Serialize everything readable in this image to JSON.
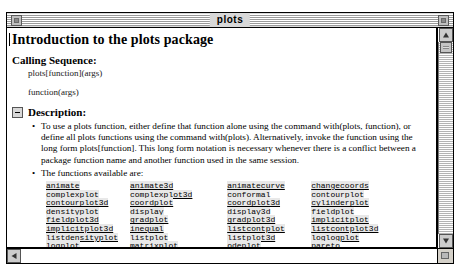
{
  "window": {
    "title": "plots",
    "close_box": "close-box",
    "zoom_box": "zoom-box"
  },
  "document": {
    "title": "Introduction to the plots package",
    "calling_sequence": {
      "heading": "Calling Sequence:",
      "lines": [
        "plots[function](args)",
        "function(args)"
      ]
    },
    "description": {
      "heading": "Description:",
      "collapse_state": "expanded",
      "bullets": [
        "To use a plots function, either define that function alone using the command with(plots, function), or define all plots functions using the command with(plots). Alternatively, invoke the function using the long form plots[function]. This long form notation is necessary whenever there is a conflict between a package function name and another function used in the same session.",
        "The functions available are:"
      ]
    },
    "functions": [
      [
        "animate",
        "animate3d",
        "animatecurve",
        "changecoords"
      ],
      [
        "complexplot",
        "complexplot3d",
        "conformal",
        "contourplot"
      ],
      [
        "contourplot3d",
        "coordplot",
        "coordplot3d",
        "cylinderplot"
      ],
      [
        "densityplot",
        "display",
        "display3d",
        "fieldplot"
      ],
      [
        "fieldplot3d",
        "gradplot",
        "gradplot3d",
        "implicitplot"
      ],
      [
        "implicitplot3d",
        "inequal",
        "listcontplot",
        "listcontplot3d"
      ],
      [
        "listdensityplot",
        "listplot",
        "listplot3d",
        "loglogplot"
      ],
      [
        "logplot",
        "matrixplot",
        "odeplot",
        "pareto"
      ],
      [
        "pointplot",
        "pointplot3d",
        "polarplot",
        "polygonplot"
      ],
      [
        "polygonplot3d",
        "polyhedra_supported",
        "polyhedraplot",
        "replot"
      ]
    ]
  },
  "scrollbars": {
    "vertical": {
      "up_arrow": "scroll-up-arrow",
      "down_arrow": "scroll-down-arrow",
      "thumb": "vertical-scroll-thumb"
    },
    "horizontal": {
      "left_arrow": "scroll-left-arrow"
    }
  }
}
